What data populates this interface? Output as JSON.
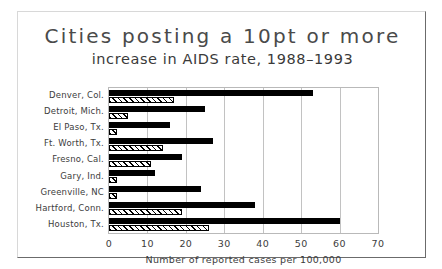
{
  "figure": {
    "title_main": "Cities posting a 10pt or more",
    "title_sub": "increase in AIDS rate, 1988–1993"
  },
  "chart_data": {
    "type": "bar",
    "orientation": "horizontal",
    "title": "Cities posting a 10pt or more increase in AIDS rate, 1988–1993",
    "xlabel": "Number of reported cases per 100,000",
    "ylabel": "",
    "xlim": [
      0,
      70
    ],
    "xticks": [
      0,
      10,
      20,
      30,
      40,
      50,
      60,
      70
    ],
    "xtick_labels": [
      "0",
      "10",
      "20",
      "30",
      "40",
      "50",
      "60",
      "70"
    ],
    "grid": "vertical",
    "legend": "none",
    "categories": [
      "Denver, Col.",
      "Detroit, Mich.",
      "El Paso, Tx.",
      "Ft. Worth, Tx.",
      "Fresno, Cal.",
      "Gary, Ind.",
      "Greenville, NC",
      "Hartford, Conn.",
      "Houston, Tx."
    ],
    "series": [
      {
        "name": "1993",
        "style": "solid-black",
        "color": "#000000",
        "values": [
          53,
          25,
          16,
          27,
          19,
          12,
          24,
          38,
          60
        ]
      },
      {
        "name": "1988",
        "style": "hatched",
        "color": "#ffffff",
        "values": [
          17,
          5,
          2,
          14,
          11,
          2,
          2,
          19,
          26
        ]
      }
    ]
  }
}
